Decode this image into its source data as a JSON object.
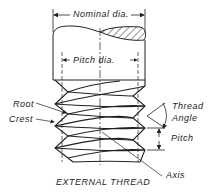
{
  "diagram": {
    "title": "EXTERNAL THREAD",
    "labels": {
      "nominal_dia": "Nominal dia.",
      "pitch_dia": "Pitch dia.",
      "root": "Root",
      "crest": "Crest",
      "thread_angle_line1": "Thread",
      "thread_angle_line2": "Angle",
      "pitch": "Pitch",
      "axis": "Axis"
    },
    "colors": {
      "line": "#222222",
      "background": "#ffffff"
    }
  }
}
